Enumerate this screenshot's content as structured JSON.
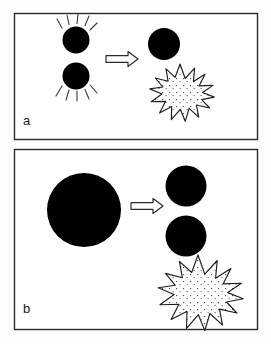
{
  "figure": {
    "title": "",
    "type": "two-panel schematic diagram",
    "background_color": "#fdfdfd",
    "ink_color": "#1a1a1a",
    "fill_color": "#000000",
    "width": 271,
    "height": 344
  },
  "panels": [
    {
      "id": "panel-a",
      "label": "a",
      "frame": {
        "x": 14,
        "y": 13,
        "w": 244,
        "h": 127
      },
      "description": "two small black circles with radiating lines merge into one black circle plus a stippled burst",
      "left_objects": [
        {
          "name": "circle-top",
          "cx": 76,
          "cy": 40,
          "r": 13.5,
          "fill": "#000000",
          "rays": 5,
          "ray_side": "up"
        },
        {
          "name": "circle-bottom",
          "cx": 76,
          "cy": 76,
          "r": 13.5,
          "fill": "#000000",
          "rays": 5,
          "ray_side": "down"
        }
      ],
      "arrow": {
        "name": "reaction-arrow",
        "x1": 106,
        "x2": 137,
        "y": 59,
        "direction": "right",
        "style": "hollow-outline"
      },
      "right_objects": [
        {
          "name": "product-circle",
          "cx": 164,
          "cy": 44,
          "r": 16,
          "fill": "#000000"
        },
        {
          "name": "energy-burst",
          "cx": 180,
          "cy": 89,
          "r_outer": 25,
          "r_inner": 16,
          "points": 16,
          "fill": "stippled",
          "stroke": "#1a1a1a"
        }
      ]
    },
    {
      "id": "panel-b",
      "label": "b",
      "frame": {
        "x": 14,
        "y": 149,
        "w": 244,
        "h": 181
      },
      "description": "one large black circle splits into two black circles plus a stippled burst",
      "left_objects": [
        {
          "name": "parent-circle",
          "cx": 84,
          "cy": 210,
          "r": 37,
          "fill": "#000000"
        }
      ],
      "arrow": {
        "name": "reaction-arrow",
        "x1": 131,
        "x2": 161,
        "y": 206,
        "direction": "right",
        "style": "hollow-outline"
      },
      "right_objects": [
        {
          "name": "daughter-circle-top",
          "cx": 186,
          "cy": 186,
          "r": 20.5,
          "fill": "#000000"
        },
        {
          "name": "daughter-circle-bottom",
          "cx": 186,
          "cy": 236,
          "r": 20.5,
          "fill": "#000000"
        },
        {
          "name": "energy-burst",
          "cx": 198,
          "cy": 288,
          "r_outer": 33,
          "r_inner": 21,
          "points": 16,
          "fill": "stippled",
          "stroke": "#1a1a1a"
        }
      ]
    }
  ]
}
